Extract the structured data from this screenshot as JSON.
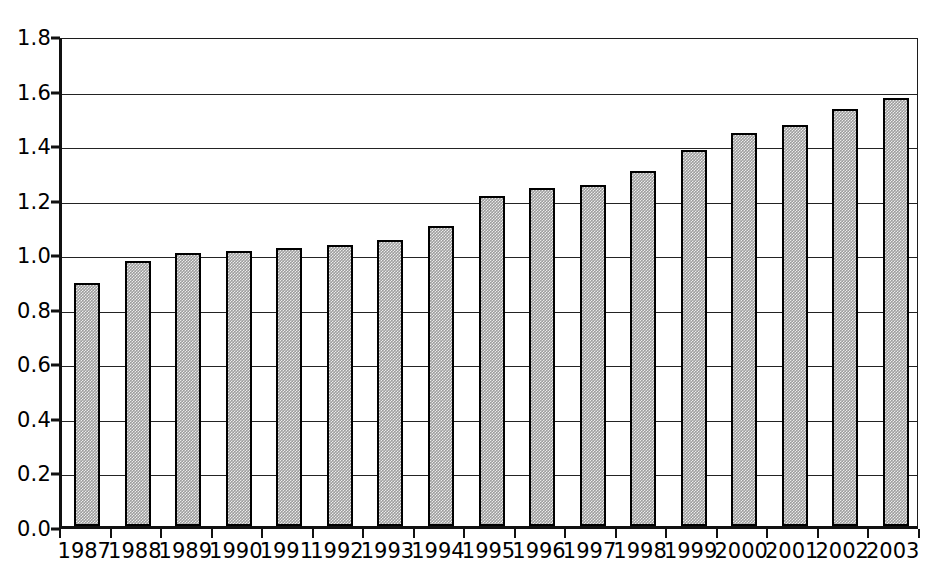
{
  "chart_data": {
    "type": "bar",
    "title": "",
    "subtitle": "",
    "xlabel": "",
    "ylabel": "",
    "categories": [
      "1987",
      "1988",
      "1989",
      "1990",
      "1991",
      "1992",
      "1993",
      "1994",
      "1995",
      "1996",
      "1997",
      "1998",
      "1999",
      "2000",
      "2001",
      "2002",
      "2003"
    ],
    "values": [
      0.89,
      0.97,
      1.0,
      1.01,
      1.02,
      1.03,
      1.05,
      1.1,
      1.21,
      1.24,
      1.25,
      1.3,
      1.38,
      1.44,
      1.47,
      1.53,
      1.57
    ],
    "ylim": [
      0.0,
      1.8
    ],
    "ytick_labels": [
      "0.0",
      "0.2",
      "0.4",
      "0.6",
      "0.8",
      "1.0",
      "1.2",
      "1.4",
      "1.6",
      "1.8"
    ],
    "ytick_values": [
      0.0,
      0.2,
      0.4,
      0.6,
      0.8,
      1.0,
      1.2,
      1.4,
      1.6,
      1.8
    ],
    "grid": true,
    "grid_axis": "y",
    "legend": null,
    "legend_position": "none",
    "annotations": [],
    "series": [
      {
        "name": "",
        "values": [
          0.89,
          0.97,
          1.0,
          1.01,
          1.02,
          1.03,
          1.05,
          1.1,
          1.21,
          1.24,
          1.25,
          1.3,
          1.38,
          1.44,
          1.47,
          1.53,
          1.57
        ]
      }
    ]
  },
  "style": {
    "bar_fill_color": "#9d9d9d",
    "bar_border_color": "#000000",
    "axis_color": "#111111",
    "gridline_color": "#232323",
    "background_color": "#ffffff",
    "text_color": "#000000"
  }
}
